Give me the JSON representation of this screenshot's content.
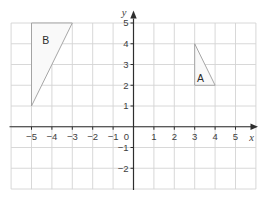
{
  "figure": {
    "colors": {
      "background": "#ffffff",
      "grid": "#d4d4d4",
      "axis": "#2e2e2e",
      "tick_text": "#3d3d3d",
      "axis_letter": "#3d3d3d",
      "shape_stroke": "#9c9c9c",
      "shape_fill": "#f9f9f9",
      "shape_text": "#2b2b2b"
    },
    "grid_range": {
      "x_min": -6,
      "x_max": 6,
      "y_min": -3,
      "y_max": 5
    },
    "x_axis": {
      "label": "x",
      "tick_labels": [
        -5,
        -4,
        -3,
        -2,
        -1,
        1,
        2,
        3,
        4,
        5
      ]
    },
    "y_axis": {
      "label": "y",
      "tick_labels": [
        -2,
        -1,
        1,
        2,
        3,
        4,
        5
      ]
    },
    "origin_label": "0",
    "shapes": [
      {
        "label": "B",
        "vertices": [
          [
            -5,
            1
          ],
          [
            -5,
            5
          ],
          [
            -3,
            5
          ]
        ],
        "label_pos": [
          -4.3,
          4.15
        ]
      },
      {
        "label": "A",
        "vertices": [
          [
            3,
            2
          ],
          [
            3,
            4
          ],
          [
            4,
            2
          ]
        ],
        "label_pos": [
          3.28,
          2.35
        ]
      }
    ]
  }
}
